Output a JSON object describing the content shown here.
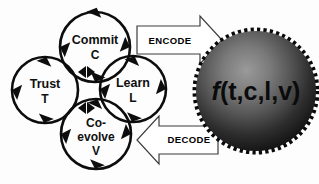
{
  "diagram": {
    "background_color": "#fdfdfd",
    "stroke_color": "#0d0d0d",
    "nodes": [
      {
        "id": "commit",
        "position": "top",
        "lines": [
          "Commit",
          "C"
        ],
        "line1": "Commit",
        "line2": "C",
        "cx": 95,
        "cy": 47,
        "r": 35
      },
      {
        "id": "trust",
        "position": "left",
        "lines": [
          "Trust",
          "T"
        ],
        "line1": "Trust",
        "line2": "T",
        "cx": 45,
        "cy": 90,
        "r": 33
      },
      {
        "id": "learn",
        "position": "right",
        "lines": [
          "Learn",
          "L"
        ],
        "line1": "Learn",
        "line2": "L",
        "cx": 133,
        "cy": 89,
        "r": 33
      },
      {
        "id": "coevolve",
        "position": "bottom",
        "lines": [
          "Co-",
          "evolve",
          "V"
        ],
        "line1": "Co-",
        "line2": "evolve",
        "line3": "V",
        "cx": 96,
        "cy": 134,
        "r": 35
      }
    ],
    "arrows": [
      {
        "id": "encode",
        "label": "ENCODE",
        "direction": "right",
        "from": "cycle",
        "to": "sphere"
      },
      {
        "id": "decode",
        "label": "DECODE",
        "direction": "left",
        "from": "sphere",
        "to": "cycle"
      }
    ],
    "sphere": {
      "formula_prefix": "f",
      "formula_args": "(t,c,l,v)",
      "formula": "f(t,c,l,v)",
      "cx": 256,
      "cy": 91,
      "r": 61,
      "gradient_light": "#8e8e8e",
      "gradient_mid": "#4a4a4a",
      "gradient_dark": "#141414",
      "edge_color": "#0a0a0a",
      "text_color": "#0b0b0b"
    }
  }
}
